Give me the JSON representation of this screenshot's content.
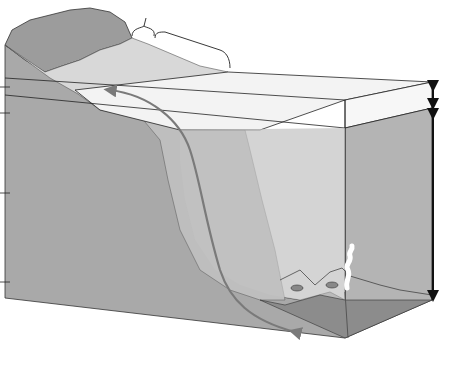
{
  "figure": {
    "number": "Figure 19.38"
  },
  "labels": {
    "intertidal": "Intertidal zone",
    "continental_shelf": "Continental shelf",
    "photic_1": "Photic",
    "photic_2": "zone",
    "aphotic_1": "Aphotic",
    "aphotic_2": "zone",
    "pelagic_1": "Pelagic",
    "pelagic_2": "zone",
    "benthic_1": "Benthic",
    "benthic_2": "zone",
    "benthic_3": "(seafloor)"
  },
  "depth_markers": [
    {
      "label": "0 m"
    },
    {
      "label": "1,000 m"
    },
    {
      "label": "5,000 m"
    },
    {
      "label": "9,000 m"
    }
  ],
  "body_text": {
    "line1": "sup",
    "line2": "such as fish",
    "line3": "and dolphins. Mic"
  },
  "colors": {
    "land_top": "#9a9a9a",
    "cross_section": "#a8a8a8",
    "water_top": "#eeeeee",
    "water_side": "#c4c4c4",
    "seafloor": "#b8b8b8",
    "caption_number": "#8e8e8e"
  }
}
